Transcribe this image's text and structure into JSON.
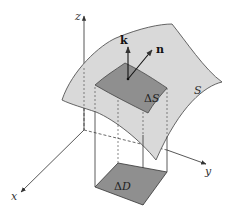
{
  "figure": {
    "axes": {
      "x_label": "x",
      "y_label": "y",
      "z_label": "z"
    },
    "vectors": {
      "k_label": "k",
      "n_label": "n"
    },
    "surface": {
      "label": "S",
      "fill": "#d9d9d9",
      "stroke": "#555555"
    },
    "surface_patch": {
      "label_delta": "Δ",
      "label_var": "S",
      "fill": "#8f8f8f"
    },
    "domain_patch": {
      "label_delta": "Δ",
      "label_var": "D",
      "fill": "#8f8f8f"
    },
    "colors": {
      "axis": "#444444",
      "line": "#333333",
      "background": "#ffffff"
    }
  }
}
